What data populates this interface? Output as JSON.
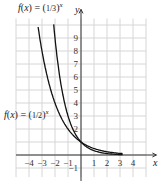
{
  "chart_data": {
    "type": "line",
    "title": "",
    "xlabel": "x",
    "ylabel": "y",
    "xlim": [
      -5,
      5
    ],
    "ylim": [
      -2,
      11
    ],
    "grid": true,
    "x_ticks": [
      "-4",
      "-3",
      "-2",
      "-1",
      "1",
      "2",
      "3",
      "4"
    ],
    "y_ticks": [
      "-1",
      "2",
      "3",
      "4",
      "5",
      "6",
      "7",
      "8",
      "9"
    ],
    "series": [
      {
        "name": "f(x) = (1/3)^x",
        "x": [
          -2.1,
          -2,
          -1,
          0,
          1,
          2,
          3
        ],
        "values": [
          10.04,
          9,
          3,
          1,
          0.333,
          0.111,
          0.037
        ]
      },
      {
        "name": "f(x) = (1/2)^x",
        "x": [
          -3.3,
          -3,
          -2,
          -1,
          0,
          1,
          2,
          3
        ],
        "values": [
          9.85,
          8,
          4,
          2,
          1,
          0.5,
          0.25,
          0.125
        ]
      }
    ],
    "annotations": [
      {
        "text": "f(x) = (1/3)^x",
        "position": "top, near y-axis"
      },
      {
        "text": "f(x) = (1/2)^x",
        "position": "left, y≈3"
      }
    ]
  },
  "labels": {
    "f13_prefix": "f(x) = ",
    "f13_frac": "1/3",
    "f12_prefix": "f(x) = ",
    "f12_frac": "1/2",
    "exp": "x",
    "x_axis": "x",
    "y_axis": "y"
  }
}
